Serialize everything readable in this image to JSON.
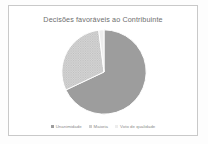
{
  "document": {
    "background_color": "#fdfdfd"
  },
  "chart_frame": {
    "border_color": "#c9c9c9",
    "background_color": "#ffffff"
  },
  "chart_data": {
    "type": "pie",
    "title": "Decisões favoráveis ao Contribuinte",
    "xlabel": "",
    "ylabel": "",
    "legend_position": "bottom",
    "grid": false,
    "categories": [
      "Unanimidade",
      "Maioria",
      "Voto de qualidade"
    ],
    "values": [
      68,
      30,
      2
    ],
    "slices": [
      {
        "label": "Unanimidade",
        "value": 68,
        "color": "#9d9d9d",
        "start_angle": 0,
        "end_angle": 244.8,
        "pattern": "solid"
      },
      {
        "label": "Maioria",
        "value": 30,
        "color": "#cfcfcf",
        "start_angle": 244.8,
        "end_angle": 352.8,
        "pattern": "dotted"
      },
      {
        "label": "Voto de qualidade",
        "value": 2,
        "color": "#ededed",
        "start_angle": 352.8,
        "end_angle": 360,
        "pattern": "solid"
      }
    ],
    "legend": [
      {
        "label": "Unanimidade",
        "color": "#9d9d9d"
      },
      {
        "label": "Maioria",
        "color": "#cfcfcf"
      },
      {
        "label": "Voto de qualidade",
        "color": "#ededed"
      }
    ]
  }
}
